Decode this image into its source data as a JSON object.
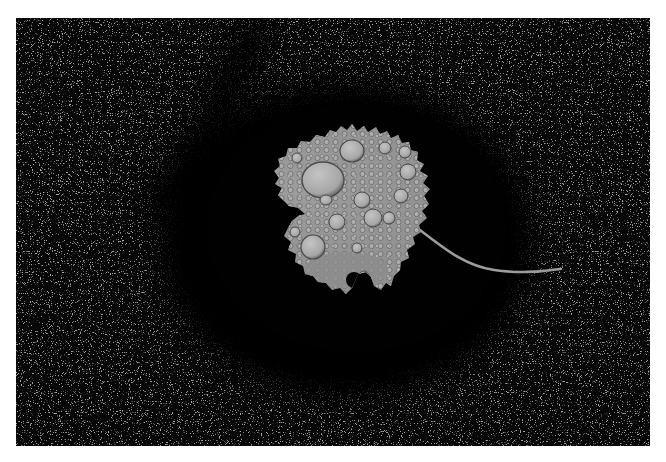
{
  "image": {
    "subject": "Water droplets on a fallen leaf",
    "description": "Grayscale photograph of a single round aspen leaf covered in water droplets, lying on dark speckled ground inside a dark oval area, with a thin curved stem extending to the right",
    "palette": {
      "background": "#050505",
      "frame": "#ffffff",
      "leaf": "#8a8a8a",
      "leaf_highlight": "#b8b8b8",
      "droplet_edge": "#4a4a4a",
      "speckle": "#6e6e6e"
    }
  }
}
